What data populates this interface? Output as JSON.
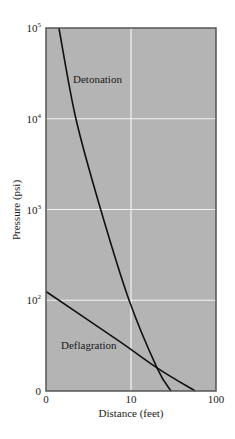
{
  "chart_data": {
    "type": "line",
    "title": "",
    "xlabel": "Distance (feet)",
    "ylabel": "Pressure (psi)",
    "x_scale": "log",
    "y_scale": "log",
    "xlim": [
      1,
      100
    ],
    "ylim": [
      10,
      100000
    ],
    "x_ticks": [
      {
        "value": 1,
        "label": "0"
      },
      {
        "value": 10,
        "label": "10"
      },
      {
        "value": 100,
        "label": "100"
      }
    ],
    "y_ticks": [
      {
        "value": 10,
        "base": "0",
        "exp": ""
      },
      {
        "value": 100,
        "base": "10",
        "exp": "2"
      },
      {
        "value": 1000,
        "base": "10",
        "exp": "3"
      },
      {
        "value": 10000,
        "base": "10",
        "exp": "4"
      },
      {
        "value": 100000,
        "base": "10",
        "exp": "5"
      }
    ],
    "grid": true,
    "legend": "inline labels",
    "series": [
      {
        "name": "Detonation",
        "x": [
          1.42,
          2.25,
          4.4,
          9.5,
          20.2,
          29.5
        ],
        "y": [
          100000,
          10000,
          1000,
          100,
          18,
          10
        ]
      },
      {
        "name": "Deflagration",
        "x": [
          1,
          7.4,
          20.2,
          56.7
        ],
        "y": [
          125,
          35,
          18,
          10
        ]
      }
    ],
    "colors": {
      "plot_background": "#b4b4b4",
      "grid": "#f2f2f2",
      "frame": "#555555",
      "line": "#111111"
    }
  }
}
